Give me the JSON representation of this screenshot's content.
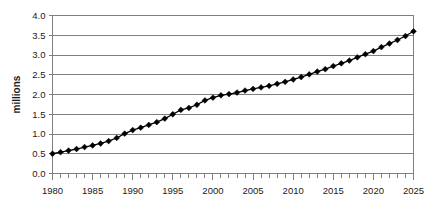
{
  "chart_data": {
    "type": "line",
    "title": "",
    "subtitle": "",
    "xlabel": "",
    "ylabel": "millions",
    "xlim": [
      1980,
      2025
    ],
    "ylim": [
      0.0,
      4.0
    ],
    "grid": true,
    "grid_axis": "y",
    "legend": false,
    "legend_position": "none",
    "marker": "diamond",
    "line_color": "#000000",
    "marker_color": "#000000",
    "grid_color": "#808080",
    "axis_color": "#808080",
    "background": "#ffffff",
    "ytick_labels": [
      "0.0",
      "0.5",
      "1.0",
      "1.5",
      "2.0",
      "2.5",
      "3.0",
      "3.5",
      "4.0"
    ],
    "ytick_values": [
      0.0,
      0.5,
      1.0,
      1.5,
      2.0,
      2.5,
      3.0,
      3.5,
      4.0
    ],
    "xtick_labels": [
      "1980",
      "1985",
      "1990",
      "1995",
      "2000",
      "2005",
      "2010",
      "2015",
      "2020",
      "2025"
    ],
    "xtick_values": [
      1980,
      1985,
      1990,
      1995,
      2000,
      2005,
      2010,
      2015,
      2020,
      2025
    ],
    "xtick_minor_step": 1,
    "x": [
      1980,
      1981,
      1982,
      1983,
      1984,
      1985,
      1986,
      1987,
      1988,
      1989,
      1990,
      1991,
      1992,
      1993,
      1994,
      1995,
      1996,
      1997,
      1998,
      1999,
      2000,
      2001,
      2002,
      2003,
      2004,
      2005,
      2006,
      2007,
      2008,
      2009,
      2010,
      2011,
      2012,
      2013,
      2014,
      2015,
      2016,
      2017,
      2018,
      2019,
      2020,
      2021,
      2022,
      2023,
      2024,
      2025
    ],
    "values": [
      0.5,
      0.54,
      0.58,
      0.62,
      0.67,
      0.71,
      0.76,
      0.82,
      0.9,
      1.01,
      1.1,
      1.16,
      1.23,
      1.3,
      1.39,
      1.5,
      1.61,
      1.66,
      1.74,
      1.85,
      1.92,
      1.98,
      2.01,
      2.05,
      2.1,
      2.14,
      2.18,
      2.22,
      2.27,
      2.32,
      2.38,
      2.44,
      2.51,
      2.58,
      2.64,
      2.72,
      2.79,
      2.86,
      2.94,
      3.02,
      3.1,
      3.2,
      3.29,
      3.38,
      3.48,
      3.6
    ],
    "series": [
      {
        "name": "millions",
        "values": [
          0.5,
          0.54,
          0.58,
          0.62,
          0.67,
          0.71,
          0.76,
          0.82,
          0.9,
          1.01,
          1.1,
          1.16,
          1.23,
          1.3,
          1.39,
          1.5,
          1.61,
          1.66,
          1.74,
          1.85,
          1.92,
          1.98,
          2.01,
          2.05,
          2.1,
          2.14,
          2.18,
          2.22,
          2.27,
          2.32,
          2.38,
          2.44,
          2.51,
          2.58,
          2.64,
          2.72,
          2.79,
          2.86,
          2.94,
          3.02,
          3.1,
          3.2,
          3.29,
          3.38,
          3.48,
          3.6
        ]
      }
    ]
  }
}
